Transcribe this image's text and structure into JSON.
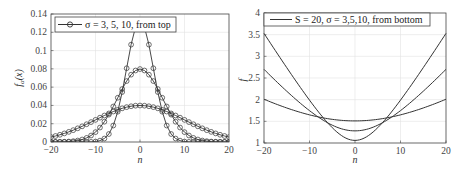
{
  "chart_data": [
    {
      "type": "line",
      "title": "",
      "xlabel": "n",
      "ylabel": "f_α(x)",
      "xlim": [
        -20,
        20
      ],
      "ylim": [
        0,
        0.14
      ],
      "xticks": [
        -20,
        -10,
        0,
        10,
        20
      ],
      "yticks": [
        0,
        0.02,
        0.04,
        0.06,
        0.08,
        0.1,
        0.12,
        0.14
      ],
      "ytick_labels": [
        "0",
        "0.02",
        "0.04",
        "0.06",
        "0.08",
        "0.1",
        "0.12",
        "0.14"
      ],
      "grid": true,
      "markers": "circle",
      "legend": {
        "position": "top-left",
        "entries": [
          "σ = 3, 5, 10, from top"
        ]
      },
      "series": [
        {
          "name": "σ = 3",
          "function": "gaussian",
          "sigma": 3,
          "peak": 0.133
        },
        {
          "name": "σ = 5",
          "function": "gaussian",
          "sigma": 5,
          "peak": 0.08
        },
        {
          "name": "σ = 10",
          "function": "gaussian",
          "sigma": 10,
          "peak": 0.04
        }
      ],
      "x_sample": "integers from -20 to 20"
    },
    {
      "type": "line",
      "title": "",
      "xlabel": "n",
      "ylabel": "f",
      "xlim": [
        -20,
        20
      ],
      "ylim": [
        1,
        4
      ],
      "xticks": [
        -20,
        -10,
        0,
        10,
        20
      ],
      "yticks": [
        1,
        1.5,
        2,
        2.5,
        3,
        3.5,
        4
      ],
      "ytick_labels": [
        "1",
        "1.5",
        "2",
        "2.5",
        "3",
        "3.5",
        "4"
      ],
      "grid": true,
      "markers": "none",
      "legend": {
        "position": "top",
        "entries": [
          "S = 20, σ = 3,5,10, from bottom"
        ]
      },
      "series": [
        {
          "name": "σ = 3",
          "center": 1.06,
          "edge": 3.53
        },
        {
          "name": "σ = 5",
          "center": 1.28,
          "edge": 2.7
        },
        {
          "name": "σ = 10",
          "center": 1.51,
          "edge": 2.01
        }
      ]
    }
  ],
  "left_plot": {
    "xlabel": "n",
    "ylabel_main": "f",
    "ylabel_sub": "α",
    "ylabel_arg": "(x)",
    "legend": "σ = 3, 5, 10, from top"
  },
  "right_plot": {
    "xlabel": "n",
    "ylabel": "f",
    "legend": "S = 20, σ = 3,5,10, from bottom"
  }
}
